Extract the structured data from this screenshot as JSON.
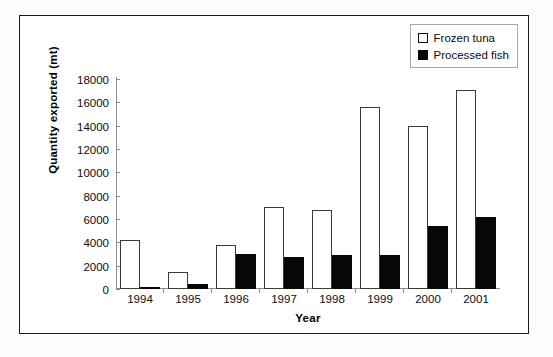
{
  "chart_data": {
    "type": "bar",
    "title": "",
    "xlabel": "Year",
    "ylabel": "Quantity exported (mt)",
    "categories": [
      "1994",
      "1995",
      "1996",
      "1997",
      "1998",
      "1999",
      "2000",
      "2001"
    ],
    "series": [
      {
        "name": "Frozen tuna",
        "color": "#ffffff",
        "values": [
          4200,
          1450,
          3750,
          7000,
          6750,
          15600,
          13950,
          17100
        ]
      },
      {
        "name": "Processed fish",
        "color": "#0a0a0a",
        "values": [
          150,
          400,
          3000,
          2750,
          2900,
          2950,
          5400,
          6150
        ]
      }
    ],
    "ylim": [
      0,
      18000
    ],
    "yticks": [
      "18000",
      "16000",
      "14000",
      "12000",
      "10000",
      "8000",
      "6000",
      "4000",
      "2000",
      "0"
    ],
    "ytick_values": [
      18000,
      16000,
      14000,
      12000,
      10000,
      8000,
      6000,
      4000,
      2000,
      0
    ],
    "grid": false,
    "legend_position": "top-right"
  },
  "legend": {
    "items": [
      {
        "label": "Frozen tuna",
        "marker": "open-square"
      },
      {
        "label": "Processed fish",
        "marker": "filled-square"
      }
    ]
  }
}
